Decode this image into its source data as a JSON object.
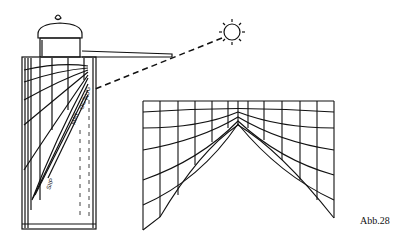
{
  "figure": {
    "caption": "Abb.28",
    "month_labels": [
      "OCT",
      "MAY",
      "AUG",
      "SEP",
      "JUL"
    ],
    "elements": {
      "sun": "sun-icon",
      "shadow_ray": "dashed line from sun to gnomon tip and onto dial",
      "cylinder": "sundial body with curved hour lines",
      "unrolled_grid": "arched hour-line grid (developed surface)"
    },
    "colors": {
      "ink": "#111111",
      "paper": "#ffffff"
    }
  }
}
